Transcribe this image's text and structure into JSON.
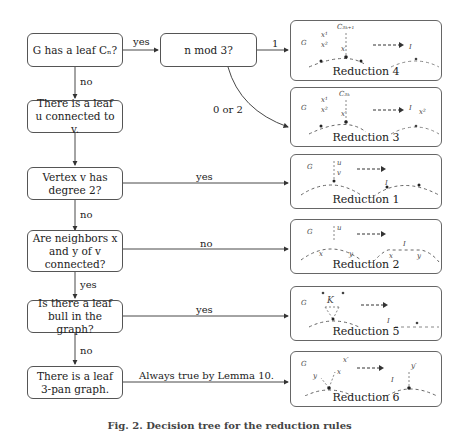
{
  "decisions": [
    {
      "id": "leaf-cn",
      "text": "G has a leaf Cₙ?"
    },
    {
      "id": "n-mod-3",
      "text": "n mod 3?"
    },
    {
      "id": "leaf-u",
      "text": "There is a leaf u connected to v."
    },
    {
      "id": "degree-2",
      "text": "Vertex v has degree 2?"
    },
    {
      "id": "neighbors",
      "text": "Are neighbors x and y of v connected?"
    },
    {
      "id": "leaf-bull",
      "text": "Is there a leaf bull in the graph?"
    },
    {
      "id": "leaf-3pan",
      "text": "There is a leaf 3-pan graph."
    }
  ],
  "edge_labels": {
    "cn_yes": "yes",
    "cn_no": "no",
    "mod_1": "1",
    "mod_0_or_2": "0 or 2",
    "deg_yes": "yes",
    "deg_no": "no",
    "nb_no": "no",
    "nb_yes": "yes",
    "bull_yes": "yes",
    "bull_no": "no",
    "pan_always": "Always true by Lemma 10."
  },
  "reductions": [
    {
      "label": "Reduction 4",
      "g": "G",
      "i": "I",
      "top": "C₃ₖ₊₁"
    },
    {
      "label": "Reduction 3",
      "g": "G",
      "i": "I",
      "top": "C₃ₖ"
    },
    {
      "label": "Reduction 1",
      "g": "G",
      "i": "I"
    },
    {
      "label": "Reduction 2",
      "g": "G",
      "i": "I"
    },
    {
      "label": "Reduction 5",
      "g": "G",
      "i": "I",
      "k": "K"
    },
    {
      "label": "Reduction 6",
      "g": "G",
      "i": "I"
    }
  ],
  "caption": "Fig. 2. Decision tree for the reduction rules"
}
